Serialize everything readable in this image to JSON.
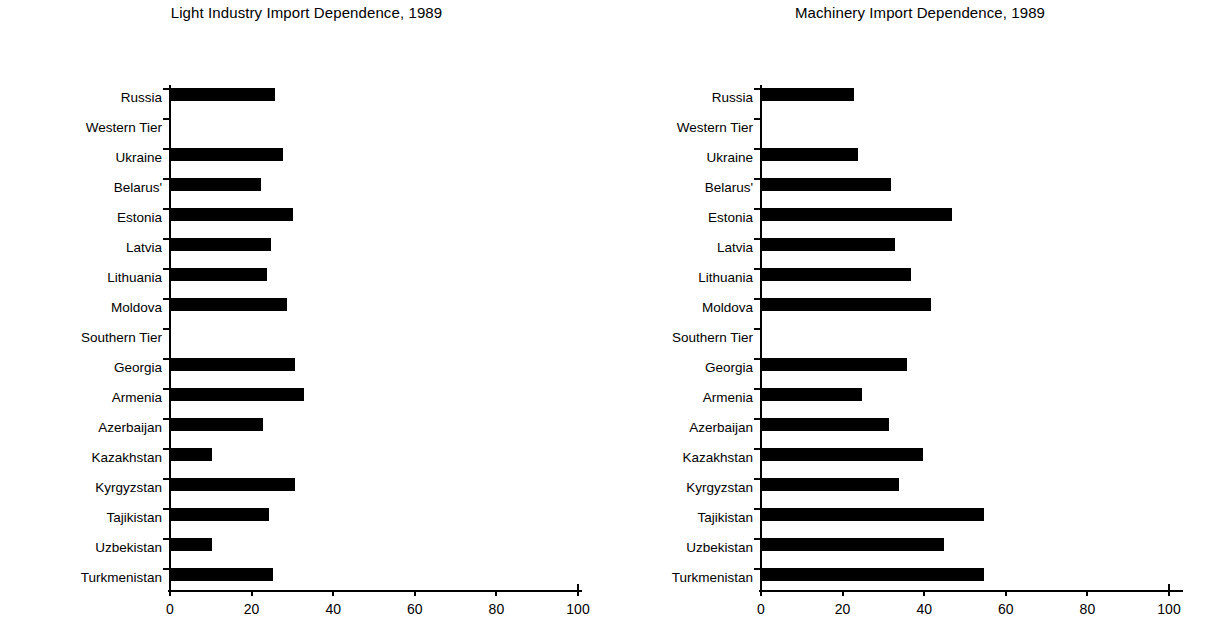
{
  "page": {
    "background": "#ffffff",
    "bar_color": "#000000",
    "axis_color": "#000000"
  },
  "charts": [
    {
      "id": "light-industry",
      "title": "Light Industry Import Dependence, 1989",
      "xlabel": "",
      "ylabel": "",
      "xticks": [
        "0",
        "20",
        "40",
        "60",
        "80",
        "100"
      ],
      "categories": [
        "Russia",
        "Western Tier",
        "Ukraine",
        "Belarus'",
        "Estonia",
        "Latvia",
        "Lithuania",
        "Moldova",
        "Southern Tier",
        "Georgia",
        "Armenia",
        "Azerbaijan",
        "Kazakhstan",
        "Kyrgyzstan",
        "Tajikistan",
        "Uzbekistan",
        "Turkmenistan"
      ],
      "values": [
        26,
        null,
        28,
        22.5,
        30.5,
        25,
        24,
        29,
        null,
        31,
        33,
        23,
        10.5,
        31,
        24.5,
        10.5,
        25.5
      ]
    },
    {
      "id": "machinery",
      "title": "Machinery Import Dependence, 1989",
      "xlabel": "",
      "ylabel": "",
      "xticks": [
        "0",
        "20",
        "40",
        "60",
        "80",
        "100"
      ],
      "categories": [
        "Russia",
        "Western Tier",
        "Ukraine",
        "Belarus'",
        "Estonia",
        "Latvia",
        "Lithuania",
        "Moldova",
        "Southern Tier",
        "Georgia",
        "Armenia",
        "Azerbaijan",
        "Kazakhstan",
        "Kyrgyzstan",
        "Tajikistan",
        "Uzbekistan",
        "Turkmenistan"
      ],
      "values": [
        23,
        null,
        24,
        32,
        47,
        33,
        37,
        42,
        null,
        36,
        25,
        31.5,
        40,
        34,
        55,
        45,
        55
      ]
    }
  ],
  "chart_data": [
    {
      "type": "bar",
      "orientation": "horizontal",
      "title": "Light Industry Import Dependence, 1989",
      "xlabel": "",
      "ylabel": "",
      "xlim": [
        0,
        100
      ],
      "xticks": [
        0,
        20,
        40,
        60,
        80,
        100
      ],
      "grid": false,
      "legend": "none",
      "categories": [
        "Russia",
        "Western Tier",
        "Ukraine",
        "Belarus'",
        "Estonia",
        "Latvia",
        "Lithuania",
        "Moldova",
        "Southern Tier",
        "Georgia",
        "Armenia",
        "Azerbaijan",
        "Kazakhstan",
        "Kyrgyzstan",
        "Tajikistan",
        "Uzbekistan",
        "Turkmenistan"
      ],
      "values": [
        26,
        null,
        28,
        22.5,
        30.5,
        25,
        24,
        29,
        null,
        31,
        33,
        23,
        10.5,
        31,
        24.5,
        10.5,
        25.5
      ],
      "notes": "Western Tier and Southern Tier are group heading rows with no bar"
    },
    {
      "type": "bar",
      "orientation": "horizontal",
      "title": "Machinery Import Dependence, 1989",
      "xlabel": "",
      "ylabel": "",
      "xlim": [
        0,
        100
      ],
      "xticks": [
        0,
        20,
        40,
        60,
        80,
        100
      ],
      "grid": false,
      "legend": "none",
      "categories": [
        "Russia",
        "Western Tier",
        "Ukraine",
        "Belarus'",
        "Estonia",
        "Latvia",
        "Lithuania",
        "Moldova",
        "Southern Tier",
        "Georgia",
        "Armenia",
        "Azerbaijan",
        "Kazakhstan",
        "Kyrgyzstan",
        "Tajikistan",
        "Uzbekistan",
        "Turkmenistan"
      ],
      "values": [
        23,
        null,
        24,
        32,
        47,
        33,
        37,
        42,
        null,
        36,
        25,
        31.5,
        40,
        34,
        55,
        45,
        55
      ],
      "notes": "Western Tier and Southern Tier are group heading rows with no bar"
    }
  ]
}
